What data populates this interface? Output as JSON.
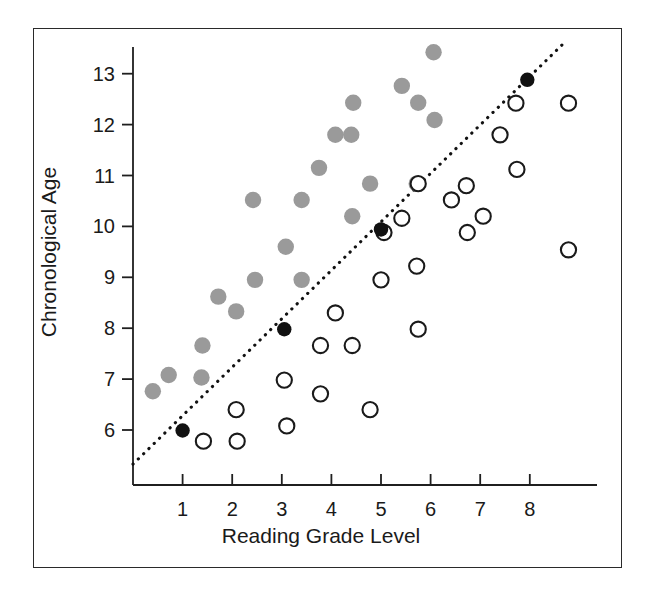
{
  "chart_data": {
    "type": "scatter",
    "title": "",
    "xlabel": "Reading Grade Level",
    "ylabel": "Chronological Age",
    "xlim": [
      0,
      9.4
    ],
    "ylim": [
      5.3,
      13.8
    ],
    "xticks": [
      1,
      2,
      3,
      4,
      5,
      6,
      7,
      8
    ],
    "yticks": [
      6,
      7,
      8,
      9,
      10,
      11,
      12,
      13
    ],
    "xtick_labels": [
      "1",
      "2",
      "3",
      "4",
      "5",
      "6",
      "7",
      "8"
    ],
    "ytick_labels": [
      "6",
      "7",
      "8",
      "9",
      "10",
      "11",
      "12",
      "13"
    ],
    "grid": false,
    "legend": "none",
    "annotations": [
      {
        "name": "identity-reference-line",
        "type": "dotted-line",
        "description": "dotted diagonal reference line passing through the black points",
        "from": [
          0.0,
          5.33
        ],
        "to": [
          8.75,
          13.66
        ],
        "color": "#111111"
      }
    ],
    "series": [
      {
        "name": "above-reference",
        "marker": "filled-circle",
        "color": "#9a9a9a",
        "points": [
          [
            0.4,
            6.76
          ],
          [
            0.72,
            7.08
          ],
          [
            1.38,
            7.03
          ],
          [
            1.4,
            7.66
          ],
          [
            1.72,
            8.62
          ],
          [
            2.08,
            8.33
          ],
          [
            2.42,
            10.52
          ],
          [
            2.46,
            8.95
          ],
          [
            3.08,
            9.6
          ],
          [
            3.4,
            10.52
          ],
          [
            3.4,
            8.95
          ],
          [
            3.75,
            11.15
          ],
          [
            4.08,
            11.8
          ],
          [
            4.4,
            11.8
          ],
          [
            4.42,
            10.2
          ],
          [
            4.44,
            12.43
          ],
          [
            4.78,
            10.84
          ],
          [
            5.42,
            12.76
          ],
          [
            5.72,
            10.84
          ],
          [
            5.75,
            12.43
          ],
          [
            6.06,
            13.42
          ],
          [
            6.08,
            12.09
          ]
        ]
      },
      {
        "name": "below-reference",
        "marker": "open-circle",
        "color": "#1a1a1a",
        "points": [
          [
            1.42,
            5.78
          ],
          [
            2.08,
            6.4
          ],
          [
            2.1,
            5.78
          ],
          [
            3.05,
            6.98
          ],
          [
            3.1,
            6.08
          ],
          [
            3.78,
            6.71
          ],
          [
            3.78,
            7.66
          ],
          [
            4.08,
            8.3
          ],
          [
            4.42,
            7.66
          ],
          [
            4.78,
            6.4
          ],
          [
            5.0,
            8.95
          ],
          [
            5.06,
            9.88
          ],
          [
            5.42,
            10.16
          ],
          [
            5.72,
            9.22
          ],
          [
            5.75,
            7.98
          ],
          [
            5.75,
            10.84
          ],
          [
            6.42,
            10.52
          ],
          [
            6.72,
            10.8
          ],
          [
            6.74,
            9.88
          ],
          [
            7.06,
            10.2
          ],
          [
            7.4,
            11.8
          ],
          [
            7.72,
            12.42
          ],
          [
            7.74,
            11.12
          ],
          [
            8.78,
            12.42
          ],
          [
            8.78,
            9.54
          ]
        ]
      },
      {
        "name": "on-reference",
        "marker": "filled-circle-black",
        "color": "#111111",
        "points": [
          [
            1.0,
            5.99
          ],
          [
            3.05,
            7.98
          ],
          [
            5.0,
            9.94
          ],
          [
            7.95,
            12.88
          ]
        ]
      }
    ]
  },
  "figure": {
    "background_color": "#ffffff",
    "frame_color": "#2a2a2a",
    "axis_color": "#1f1f1f"
  }
}
